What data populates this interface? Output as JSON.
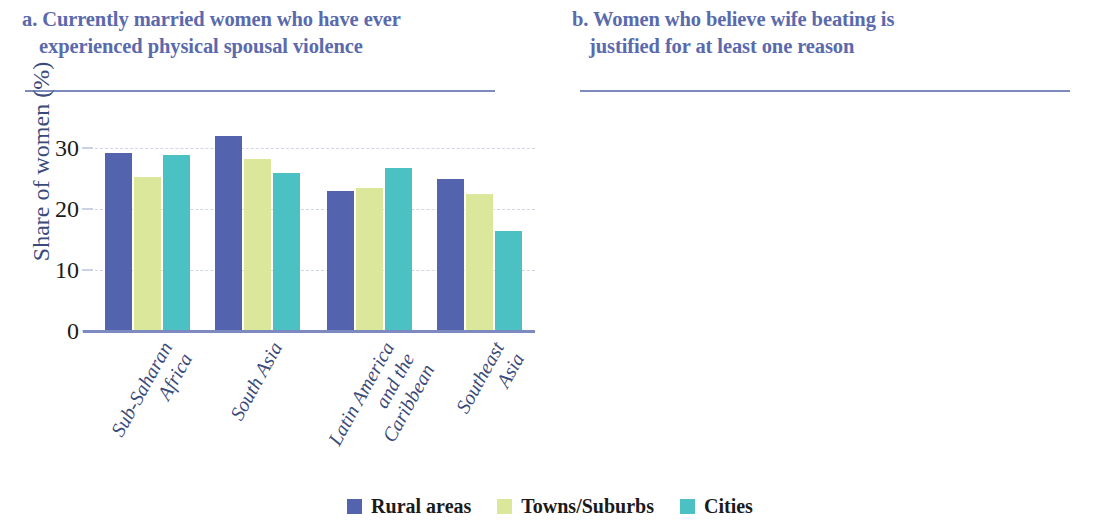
{
  "colors": {
    "series_rural": "#5363ae",
    "series_towns": "#dbe89c",
    "series_cities": "#4cc1c4",
    "title": "#5a6aad",
    "axis_text": "#3a4a7a",
    "rule": "#7c8abf",
    "grid": "#cfd6e6"
  },
  "legend": {
    "items": [
      {
        "label": "Rural areas",
        "color": "#5363ae",
        "swatch": "legend-swatch-rural"
      },
      {
        "label": "Towns/Suburbs",
        "color": "#dbe89c",
        "swatch": "legend-swatch-towns"
      },
      {
        "label": "Cities",
        "color": "#4cc1c4",
        "swatch": "legend-swatch-cities"
      }
    ]
  },
  "panels": [
    {
      "id": "panel-a",
      "title_line1": "a. Currently married women who have ever",
      "title_line2": "experienced physical spousal violence",
      "ylabel": "Share of women (%)",
      "yticks": [
        "0",
        "10",
        "20",
        "30"
      ]
    },
    {
      "id": "panel-b",
      "title_line1": "b. Women who believe wife beating is",
      "title_line2": "justified for at least one reason",
      "ylabel": "Share of women (%)",
      "yticks": [
        "0",
        "20",
        "40",
        "60"
      ]
    }
  ],
  "chart_data": [
    {
      "type": "bar",
      "title": "a. Currently married women who have ever experienced physical spousal violence",
      "xlabel": "",
      "ylabel": "Share of women (%)",
      "ylim": [
        0,
        33
      ],
      "yticks": [
        0,
        10,
        20,
        30
      ],
      "grid": true,
      "legend_position": "bottom-center",
      "categories": [
        "Sub-Saharan Africa",
        "South Asia",
        "Latin America and the Caribbean",
        "Southeast Asia"
      ],
      "category_lines": [
        [
          "Sub-Saharan",
          "Africa"
        ],
        [
          "South Asia"
        ],
        [
          "Latin America",
          "and the",
          "Caribbean"
        ],
        [
          "Southeast",
          "Asia"
        ]
      ],
      "series": [
        {
          "name": "Rural areas",
          "color": "#5363ae",
          "values": [
            29.3,
            32.0,
            23.0,
            25.0
          ]
        },
        {
          "name": "Towns/Suburbs",
          "color": "#dbe89c",
          "values": [
            25.3,
            28.3,
            23.4,
            22.5
          ]
        },
        {
          "name": "Cities",
          "color": "#4cc1c4",
          "values": [
            28.9,
            26.0,
            26.8,
            16.5
          ]
        }
      ]
    },
    {
      "type": "bar",
      "title": "b. Women who believe wife beating is justified for at least one reason",
      "xlabel": "",
      "ylabel": "Share of women (%)",
      "ylim": [
        0,
        66
      ],
      "yticks": [
        0,
        20,
        40,
        60
      ],
      "grid": true,
      "legend_position": "bottom-center",
      "categories": [
        "Sub-Saharan Africa",
        "South Asia",
        "Latin America and the Caribbean",
        "Southeast Asia"
      ],
      "category_lines": [
        [
          "Sub-Saharan",
          "Africa"
        ],
        [
          "South Asia"
        ],
        [
          "Latin America",
          "and the",
          "Caribbean"
        ],
        [
          "Southeast",
          "Asia"
        ]
      ],
      "series": [
        {
          "name": "Rural areas",
          "color": "#5363ae",
          "values": [
            49.0,
            45.5,
            9.5,
            63.0
          ]
        },
        {
          "name": "Towns/Suburbs",
          "color": "#dbe89c",
          "values": [
            38.5,
            40.5,
            5.5,
            61.5
          ]
        },
        {
          "name": "Cities",
          "color": "#4cc1c4",
          "values": [
            32.0,
            39.8,
            3.2,
            53.5
          ]
        }
      ]
    }
  ]
}
